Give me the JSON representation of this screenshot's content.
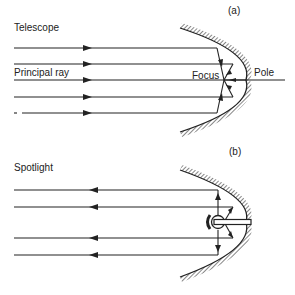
{
  "panel_a": {
    "tag": "(a)",
    "title": "Telescope",
    "principal_ray_label": "Principal ray",
    "focus_label": "Focus",
    "pole_label": "Pole"
  },
  "panel_b": {
    "tag": "(b)",
    "title": "Spotlight"
  },
  "colors": {
    "ink": "#222222",
    "background": "#ffffff"
  }
}
